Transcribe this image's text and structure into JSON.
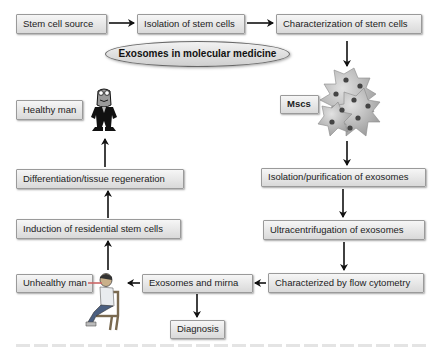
{
  "diagram": {
    "title": "Exosomes in molecular medicine",
    "nodes": {
      "stem_cell_source": "Stem cell source",
      "isolation_stem_cells": "Isolation of stem cells",
      "characterization_stem_cells": "Characterization of stem cells",
      "mscs": "Mscs",
      "isolation_purification": "Isolation/purification of exosomes",
      "ultracentrifugation": "Ultracentrifugation of exosomes",
      "flow_cytometry": "Characterized by flow cytometry",
      "exosomes_mirna": "Exosomes and mirna",
      "diagnosis": "Diagnosis",
      "unhealthy_man": "Unhealthy man",
      "induction": "Induction of residential stem cells",
      "differentiation": "Differentiation/tissue regeneration",
      "healthy_man": "Healthy man"
    },
    "edges": [
      [
        "stem_cell_source",
        "isolation_stem_cells"
      ],
      [
        "isolation_stem_cells",
        "characterization_stem_cells"
      ],
      [
        "characterization_stem_cells",
        "mscs"
      ],
      [
        "mscs",
        "isolation_purification"
      ],
      [
        "isolation_purification",
        "ultracentrifugation"
      ],
      [
        "ultracentrifugation",
        "flow_cytometry"
      ],
      [
        "flow_cytometry",
        "exosomes_mirna"
      ],
      [
        "exosomes_mirna",
        "diagnosis"
      ],
      [
        "exosomes_mirna",
        "unhealthy_man"
      ],
      [
        "unhealthy_man",
        "induction"
      ],
      [
        "induction",
        "differentiation"
      ],
      [
        "differentiation",
        "healthy_man"
      ]
    ],
    "icons": {
      "cells": "stem-cell-cluster-icon",
      "healthy": "healthy-man-icon",
      "unhealthy": "sick-man-icon"
    }
  }
}
